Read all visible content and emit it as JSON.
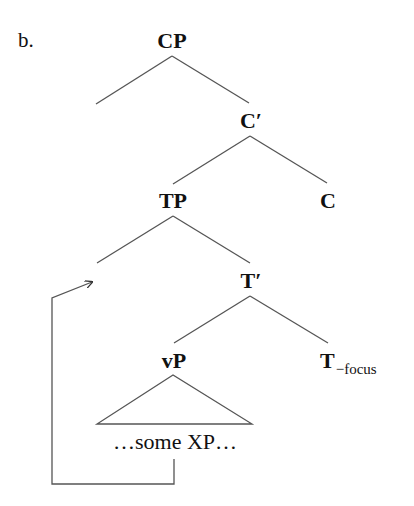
{
  "example_label": "b.",
  "tree": {
    "nodes": {
      "cp": "CP",
      "c_bar": "C′",
      "tp": "TP",
      "c": "C",
      "t_bar": "T′",
      "vp": "vP",
      "t_head": "T",
      "t_head_subscript": "−focus"
    },
    "vp_content": "…some XP…",
    "specifier_positions": [
      "Spec,CP (empty)",
      "Spec,TP (empty, landing site)"
    ],
    "movement": {
      "from": "some XP (inside vP)",
      "to": "Spec,TP",
      "style": "arrow"
    }
  },
  "colors": {
    "text": "#111111",
    "lines": "#555555",
    "background": "#ffffff"
  }
}
